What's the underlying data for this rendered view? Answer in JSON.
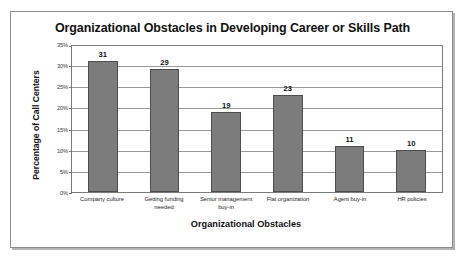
{
  "chart_data": {
    "type": "bar",
    "title": "Organizational Obstacles in Developing Career or Skills Path",
    "xlabel": "Organizational Obstacles",
    "ylabel": "Percentage of Call Centers",
    "categories": [
      "Company culture",
      "Getting funding needed",
      "Senior management buy-in",
      "Flat organization",
      "Agent buy-in",
      "HR policies"
    ],
    "values": [
      31,
      29,
      19,
      23,
      11,
      10
    ],
    "value_labels": [
      "31",
      "29",
      "19",
      "23",
      "11",
      "10"
    ],
    "ylim": [
      0,
      35
    ],
    "ytick_values": [
      0,
      5,
      10,
      15,
      20,
      25,
      30,
      35
    ],
    "ytick_labels": [
      "0%",
      "5%",
      "10%",
      "15%",
      "20%",
      "25%",
      "30%",
      "35%"
    ],
    "grid": "horizontal",
    "legend": "none",
    "bar_color": "#7c7c7c",
    "bar_border_color": "#4e4e4e",
    "plot_background": "#ffffff",
    "gridline_color": "#9a9a9a",
    "axis_color": "#7a7a7a"
  }
}
